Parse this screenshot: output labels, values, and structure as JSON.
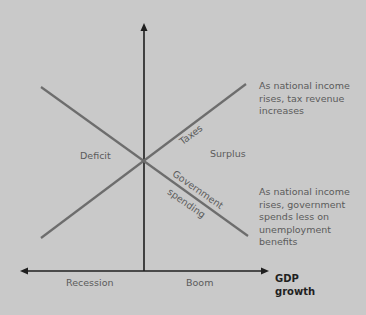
{
  "diagram": {
    "colors": {
      "background": "#c9c9c9",
      "axis": "#1f1f1f",
      "lines": "#6d6d6d",
      "text": "#5b5b5b"
    },
    "regions": {
      "left": "Deficit",
      "right": "Surplus"
    },
    "lines": {
      "taxes": "Taxes",
      "government_spending_line1": "Government",
      "government_spending_line2": "spending"
    },
    "notes": {
      "taxes": "As national income rises, tax revenue increases",
      "spending": "As national income rises, government spends less on unemployment benefits"
    },
    "x_axis": {
      "left_label": "Recession",
      "right_label": "Boom",
      "title_line1": "GDP",
      "title_line2": "growth"
    }
  }
}
